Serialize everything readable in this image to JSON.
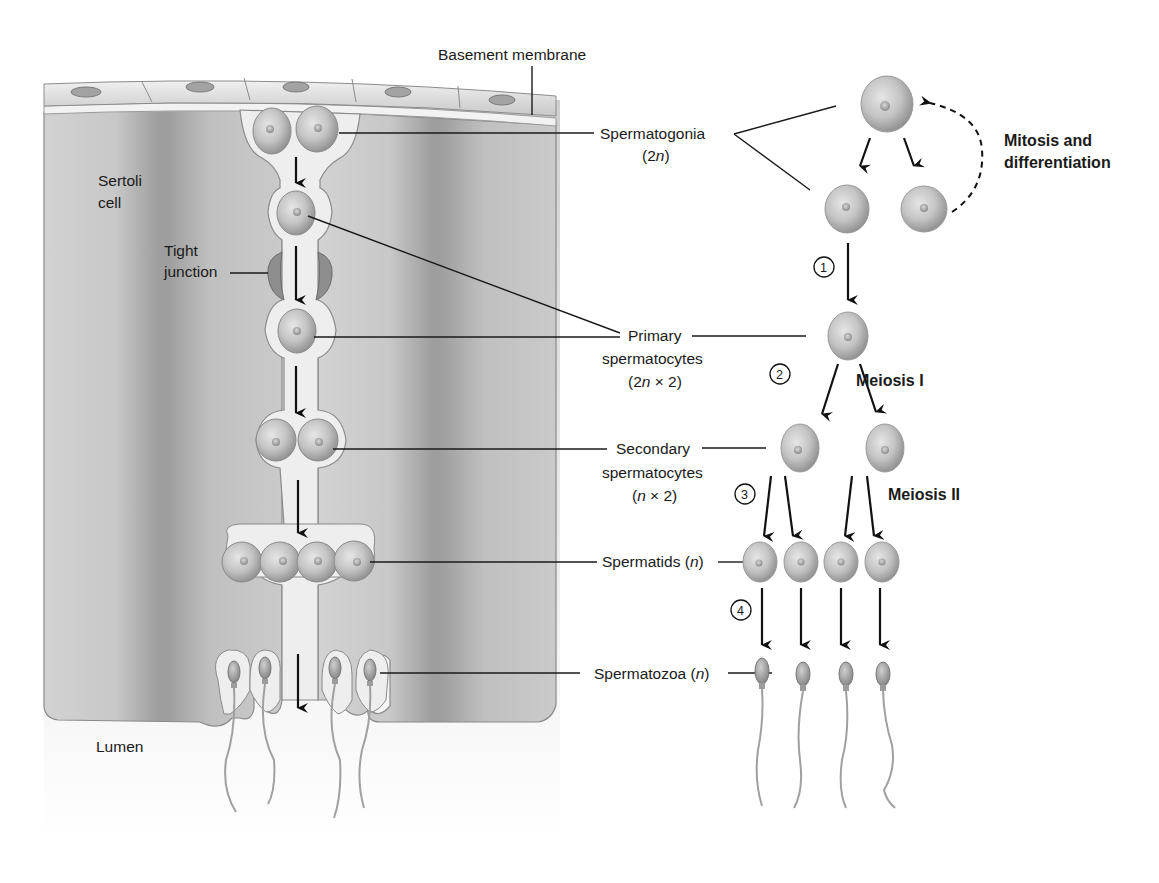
{
  "figure": {
    "labels": {
      "basement_membrane": "Basement membrane",
      "sertoli_line1": "Sertoli",
      "sertoli_line2": "cell",
      "tight_line1": "Tight",
      "tight_line2": "junction",
      "lumen": "Lumen",
      "spermatogonia": "Spermatogonia",
      "spermatogonia_ploidy_pre": "(2",
      "spermatogonia_ploidy_n": "n",
      "spermatogonia_ploidy_post": ")",
      "primary_line1": "Primary",
      "primary_line2": "spermatocytes",
      "primary_ploidy_pre": "(2",
      "primary_ploidy_n": "n",
      "primary_ploidy_post": " × 2)",
      "secondary_line1": "Secondary",
      "secondary_line2": "spermatocytes",
      "secondary_ploidy_pre": "(",
      "secondary_ploidy_n": "n",
      "secondary_ploidy_post": " × 2)",
      "spermatids_pre": "Spermatids (",
      "spermatids_n": "n",
      "spermatids_post": ")",
      "spermatozoa_pre": "Spermatozoa (",
      "spermatozoa_n": "n",
      "spermatozoa_post": ")",
      "mitosis_line1": "Mitosis and",
      "mitosis_line2": "differentiation",
      "meiosis1": "Meiosis I",
      "meiosis2": "Meiosis II"
    },
    "steps": [
      "1",
      "2",
      "3",
      "4"
    ],
    "colors": {
      "sertoli": "#b9b9b9",
      "sertoli_dark": "#a4a4a4",
      "channel": "#ececec",
      "cell_fill": "#c6c6c6",
      "cell_edge": "#8e8e8e",
      "membrane": "#dcdcdc",
      "ink": "#111111"
    }
  }
}
